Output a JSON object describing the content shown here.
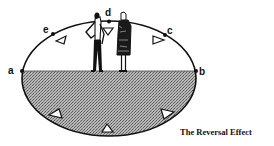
{
  "diagram": {
    "caption": "The Reversal Effect",
    "points": [
      {
        "id": "a",
        "label": "a"
      },
      {
        "id": "b",
        "label": "b"
      },
      {
        "id": "c",
        "label": "c"
      },
      {
        "id": "d",
        "label": "d"
      },
      {
        "id": "e",
        "label": "e"
      }
    ],
    "figures": [
      "man-figure",
      "woman-figure"
    ],
    "colors": {
      "line": "#111111",
      "shade": "#9a9a9a",
      "background": "#ffffff"
    }
  }
}
